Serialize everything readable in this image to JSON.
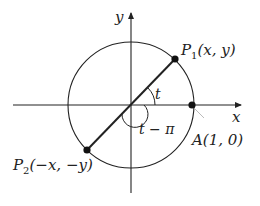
{
  "diagram": {
    "axes": {
      "x_label": "x",
      "y_label": "y"
    },
    "points": [
      {
        "id": "P1",
        "label_main": "P",
        "label_sub": "1",
        "label_coords": "(x, y)"
      },
      {
        "id": "P2",
        "label_main": "P",
        "label_sub": "2",
        "label_coords": "(−x, −y)"
      },
      {
        "id": "A",
        "label": "A(1, 0)"
      }
    ],
    "angles": [
      {
        "label": "t"
      },
      {
        "label": "t − π"
      }
    ],
    "colors": {
      "stroke": "#222222",
      "background": "#ffffff"
    }
  }
}
